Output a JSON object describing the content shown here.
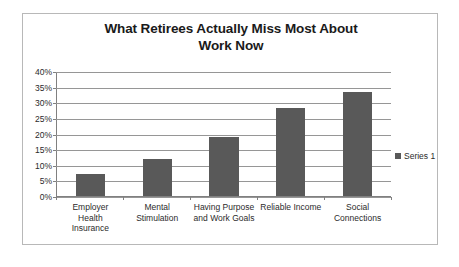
{
  "chart_data": {
    "type": "bar",
    "title": "What Retirees Actually Miss Most About Work Now",
    "title_line1": "What Retirees Actually Miss Most About",
    "title_line2": "Work Now",
    "categories": [
      "Employer Health Insurance",
      "Mental Stimulation",
      "Having Purpose and Work Goals",
      "Reliable Income",
      "Social Connections"
    ],
    "category_lines": [
      [
        "Employer",
        "Health",
        "Insurance"
      ],
      [
        "Mental",
        "Stimulation"
      ],
      [
        "Having Purpose",
        "and Work Goals"
      ],
      [
        "Reliable Income"
      ],
      [
        "Social",
        "Connections"
      ]
    ],
    "series": [
      {
        "name": "Series 1",
        "values": [
          7,
          12,
          19,
          28.5,
          33.5
        ]
      }
    ],
    "values": [
      7,
      12,
      19,
      28.5,
      33.5
    ],
    "xlabel": "",
    "ylabel": "",
    "ylim": [
      0,
      40
    ],
    "ytick_values": [
      40,
      35,
      30,
      25,
      20,
      15,
      10,
      5,
      0
    ],
    "ytick_labels": [
      "40%",
      "35%",
      "30%",
      "25%",
      "20%",
      "15%",
      "10%",
      "5%",
      "0%"
    ],
    "grid": true,
    "legend_position": "right",
    "legend_entries": [
      "Series 1"
    ],
    "bar_color": "#595959",
    "gridline_color": "#969696",
    "axis_color": "#808080",
    "border_color": "#b8b8b8",
    "text_color": "#2b2b2b"
  }
}
